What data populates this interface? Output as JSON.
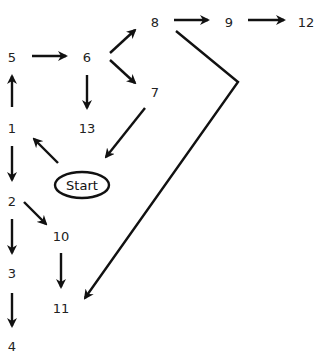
{
  "diagram": {
    "type": "flow",
    "start": {
      "label": "Start",
      "x": 82,
      "y": 185
    },
    "nodes": [
      {
        "id": "1",
        "label": "1",
        "x": 12,
        "y": 128
      },
      {
        "id": "2",
        "label": "2",
        "x": 12,
        "y": 201
      },
      {
        "id": "3",
        "label": "3",
        "x": 12,
        "y": 273
      },
      {
        "id": "4",
        "label": "4",
        "x": 12,
        "y": 346
      },
      {
        "id": "5",
        "label": "5",
        "x": 12,
        "y": 57
      },
      {
        "id": "6",
        "label": "6",
        "x": 87,
        "y": 57
      },
      {
        "id": "7",
        "label": "7",
        "x": 155,
        "y": 92
      },
      {
        "id": "8",
        "label": "8",
        "x": 155,
        "y": 22
      },
      {
        "id": "9",
        "label": "9",
        "x": 229,
        "y": 22
      },
      {
        "id": "10",
        "label": "10",
        "x": 61,
        "y": 236
      },
      {
        "id": "11",
        "label": "11",
        "x": 61,
        "y": 308
      },
      {
        "id": "12",
        "label": "12",
        "x": 306,
        "y": 22
      },
      {
        "id": "13",
        "label": "13",
        "x": 87,
        "y": 128
      }
    ],
    "edges": [
      {
        "from": "Start",
        "to": "1"
      },
      {
        "from": "1",
        "to": "5"
      },
      {
        "from": "1",
        "to": "2"
      },
      {
        "from": "5",
        "to": "6"
      },
      {
        "from": "6",
        "to": "8"
      },
      {
        "from": "6",
        "to": "7"
      },
      {
        "from": "6",
        "to": "13"
      },
      {
        "from": "7",
        "to": "Start"
      },
      {
        "from": "8",
        "to": "9"
      },
      {
        "from": "9",
        "to": "12"
      },
      {
        "from": "8",
        "to": "11",
        "via": "bend"
      },
      {
        "from": "2",
        "to": "10"
      },
      {
        "from": "2",
        "to": "3"
      },
      {
        "from": "3",
        "to": "4"
      },
      {
        "from": "10",
        "to": "11"
      }
    ],
    "colors": {
      "stroke": "#111111",
      "text": "#222222",
      "background": "#ffffff"
    }
  }
}
